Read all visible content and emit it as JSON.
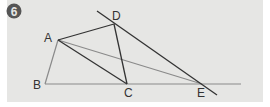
{
  "figure": {
    "badge": "6",
    "points": [
      {
        "id": "A",
        "label": "A"
      },
      {
        "id": "B",
        "label": "B"
      },
      {
        "id": "C",
        "label": "C"
      },
      {
        "id": "D",
        "label": "D"
      },
      {
        "id": "E",
        "label": "E"
      }
    ],
    "segments": [
      [
        "A",
        "B"
      ],
      [
        "B",
        "E"
      ],
      [
        "A",
        "C"
      ],
      [
        "A",
        "D"
      ],
      [
        "D",
        "C"
      ],
      [
        "A",
        "E"
      ],
      [
        "D",
        "E"
      ]
    ],
    "colors": {
      "background": "#e6e6e4",
      "dark_line": "#333333",
      "light_line": "#8a8a8a",
      "badge": "#555555"
    }
  }
}
